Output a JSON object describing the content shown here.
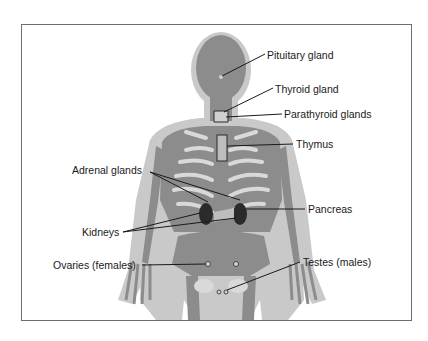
{
  "diagram": {
    "colors": {
      "outer_silhouette": "#c9c9c9",
      "inner_body": "#8c8c8c",
      "skeleton": "#d9d9d9",
      "gland_dark": "#2b2b2b",
      "leader_line": "#1a1a1a",
      "frame_border": "#6e6e6e"
    },
    "labels": {
      "pituitary": "Pituitary gland",
      "thyroid": "Thyroid gland",
      "parathyroid": "Parathyroid glands",
      "thymus": "Thymus",
      "adrenal": "Adrenal glands",
      "pancreas": "Pancreas",
      "kidneys": "Kidneys",
      "ovaries": "Ovaries (females)",
      "testes": "Testes (males)"
    }
  }
}
